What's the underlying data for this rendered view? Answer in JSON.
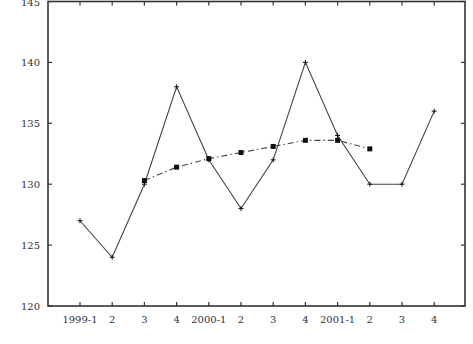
{
  "chart_data": {
    "type": "line",
    "title": "",
    "xlabel": "",
    "ylabel": "",
    "categories": [
      "1999-1",
      "2",
      "3",
      "4",
      "2000-1",
      "2",
      "3",
      "4",
      "2001-1",
      "2",
      "3",
      "4"
    ],
    "series": [
      {
        "name": "actual",
        "style": "solid",
        "marker": "plus",
        "values": [
          127,
          124,
          130,
          138,
          132,
          128,
          132,
          140,
          134,
          130,
          130,
          136
        ]
      },
      {
        "name": "moving-average",
        "style": "dash-dot",
        "marker": "square",
        "values": [
          null,
          null,
          130.3,
          131.4,
          132.1,
          132.6,
          133.1,
          133.6,
          133.6,
          132.9,
          null,
          null
        ]
      }
    ],
    "yticks": [
      120,
      125,
      130,
      135,
      140,
      145
    ],
    "ylim": [
      120,
      145
    ],
    "grid": false,
    "legend": "none"
  },
  "colors": {
    "axis": "#333333",
    "line": "#444444",
    "marker": "#111111"
  }
}
